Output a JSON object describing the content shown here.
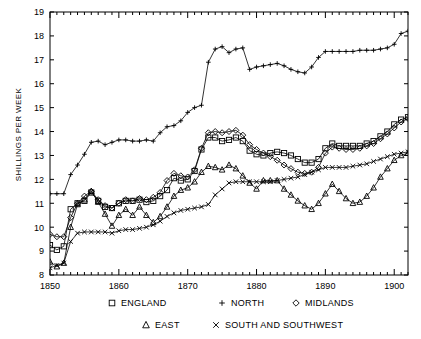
{
  "chart_data": {
    "type": "line",
    "title": "",
    "xlabel": "",
    "ylabel": "SHILLINGS PER WEEK",
    "xlim": [
      1850,
      1902
    ],
    "ylim": [
      8,
      19
    ],
    "ytick_labels": [
      "8",
      "9",
      "10",
      "11",
      "12",
      "13",
      "14",
      "15",
      "16",
      "17",
      "18",
      "19"
    ],
    "xtick_labels": [
      "1850",
      "1860",
      "1870",
      "1880",
      "1890",
      "1900"
    ],
    "xticks": [
      1850,
      1860,
      1870,
      1880,
      1890,
      1900
    ],
    "yticks": [
      8,
      9,
      10,
      11,
      12,
      13,
      14,
      15,
      16,
      17,
      18,
      19
    ],
    "minor_xtick_interval": 1,
    "grid": false,
    "legend_position": "below-axes",
    "x": [
      1850,
      1851,
      1852,
      1853,
      1854,
      1855,
      1856,
      1857,
      1858,
      1859,
      1860,
      1861,
      1862,
      1863,
      1864,
      1865,
      1866,
      1867,
      1868,
      1869,
      1870,
      1871,
      1872,
      1873,
      1874,
      1875,
      1876,
      1877,
      1878,
      1879,
      1880,
      1881,
      1882,
      1883,
      1884,
      1885,
      1886,
      1887,
      1888,
      1889,
      1890,
      1891,
      1892,
      1893,
      1894,
      1895,
      1896,
      1897,
      1898,
      1899,
      1900,
      1901,
      1902
    ],
    "series": [
      {
        "name": "ENGLAND",
        "marker": "square",
        "legend_label": "ENGLAND",
        "values": [
          9.25,
          9.05,
          9.2,
          10.75,
          11.0,
          11.1,
          11.45,
          11.1,
          10.85,
          10.8,
          11.0,
          11.1,
          11.1,
          11.15,
          11.05,
          11.1,
          11.3,
          11.55,
          12.05,
          11.95,
          12.0,
          12.35,
          13.25,
          13.75,
          13.75,
          13.6,
          13.65,
          13.75,
          13.6,
          13.2,
          13.05,
          13.0,
          13.1,
          13.15,
          13.1,
          13.0,
          12.85,
          12.7,
          12.7,
          12.85,
          13.3,
          13.5,
          13.4,
          13.4,
          13.4,
          13.4,
          13.5,
          13.6,
          13.8,
          14.0,
          14.3,
          14.5,
          14.6
        ]
      },
      {
        "name": "NORTH",
        "marker": "plus",
        "legend_label": "NORTH",
        "values": [
          11.4,
          11.4,
          11.4,
          12.2,
          12.6,
          13.05,
          13.55,
          13.6,
          13.45,
          13.55,
          13.65,
          13.65,
          13.6,
          13.6,
          13.65,
          13.6,
          13.95,
          14.2,
          14.25,
          14.45,
          14.8,
          15.0,
          15.1,
          16.9,
          17.45,
          17.55,
          17.3,
          17.45,
          17.5,
          16.6,
          16.7,
          16.75,
          16.8,
          16.85,
          16.75,
          16.6,
          16.5,
          16.45,
          16.7,
          17.1,
          17.35,
          17.35,
          17.35,
          17.35,
          17.35,
          17.4,
          17.4,
          17.4,
          17.45,
          17.5,
          17.65,
          18.1,
          18.2
        ]
      },
      {
        "name": "MIDLANDS",
        "marker": "diamond",
        "legend_label": "MIDLANDS",
        "values": [
          9.7,
          9.6,
          9.6,
          10.4,
          11.0,
          11.3,
          11.5,
          11.15,
          10.9,
          10.8,
          11.0,
          11.15,
          11.1,
          11.2,
          11.15,
          11.25,
          11.45,
          11.95,
          12.25,
          12.15,
          12.1,
          12.4,
          13.3,
          13.95,
          14.0,
          13.95,
          14.0,
          14.05,
          13.85,
          13.45,
          13.25,
          13.1,
          12.95,
          12.8,
          12.6,
          12.45,
          12.3,
          12.25,
          12.3,
          12.5,
          13.1,
          13.35,
          13.3,
          13.25,
          13.25,
          13.3,
          13.4,
          13.5,
          13.7,
          13.9,
          14.15,
          14.4,
          14.55
        ]
      },
      {
        "name": "EAST",
        "marker": "triangle",
        "legend_label": "EAST",
        "values": [
          8.55,
          8.35,
          8.5,
          10.0,
          10.95,
          11.15,
          11.5,
          11.05,
          10.55,
          10.05,
          10.5,
          10.75,
          10.5,
          10.85,
          10.5,
          10.2,
          10.45,
          10.85,
          11.3,
          11.55,
          11.65,
          11.9,
          12.3,
          12.55,
          12.5,
          12.4,
          12.6,
          12.45,
          12.15,
          11.85,
          11.6,
          11.95,
          11.95,
          11.95,
          11.6,
          11.35,
          11.1,
          10.9,
          10.75,
          11.0,
          11.4,
          11.8,
          11.5,
          11.2,
          11.0,
          11.05,
          11.3,
          11.65,
          12.1,
          12.45,
          12.8,
          13.0,
          13.1
        ]
      },
      {
        "name": "SOUTH AND SOUTHWEST",
        "marker": "cross",
        "legend_label": "SOUTH AND SOUTHWEST",
        "values": [
          8.3,
          8.4,
          8.5,
          9.4,
          9.75,
          9.8,
          9.8,
          9.8,
          9.8,
          9.75,
          9.85,
          9.9,
          9.9,
          9.95,
          10.0,
          10.1,
          10.25,
          10.45,
          10.6,
          10.7,
          10.75,
          10.8,
          10.85,
          10.95,
          11.35,
          11.6,
          11.85,
          11.9,
          11.9,
          11.9,
          11.9,
          11.9,
          11.9,
          11.95,
          12.0,
          12.05,
          12.1,
          12.2,
          12.3,
          12.4,
          12.5,
          12.5,
          12.5,
          12.5,
          12.55,
          12.6,
          12.65,
          12.75,
          12.85,
          12.95,
          13.05,
          13.1,
          13.15
        ]
      }
    ]
  },
  "legend": {
    "row1": [
      {
        "marker": "square",
        "label": "ENGLAND"
      },
      {
        "marker": "plus",
        "label": "NORTH"
      },
      {
        "marker": "diamond",
        "label": "MIDLANDS"
      }
    ],
    "row2": [
      {
        "marker": "triangle",
        "label": "EAST"
      },
      {
        "marker": "cross",
        "label": "SOUTH AND SOUTHWEST"
      }
    ]
  },
  "colors": {
    "line": "#000000",
    "axis": "#000000",
    "background": "#ffffff"
  }
}
